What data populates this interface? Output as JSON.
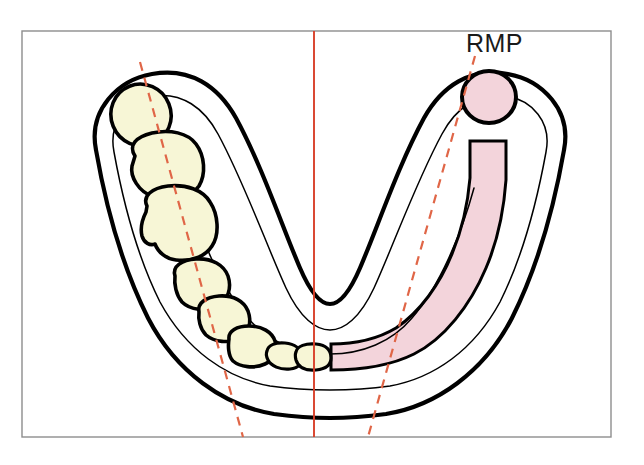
{
  "figure": {
    "background": "#ffffff",
    "frame": {
      "x": 22,
      "y": 31,
      "width": 589,
      "height": 406,
      "stroke": "#8d8d8d",
      "fill": "#ffffff"
    },
    "labels": [
      {
        "id": "rmp",
        "text": "RMP",
        "x": 466,
        "y": 52
      }
    ],
    "header_artifact": " ",
    "colors": {
      "tooth_fill": "#f7f6d6",
      "ridge_pink": "#f3d4db",
      "outline_black": "#000000",
      "midline_red": "#d9402a",
      "dashed_red": "#e06647",
      "frame_gray": "#8d8d8d",
      "page_white": "#ffffff"
    },
    "arch": {
      "description": "U-shaped mandibular (lower) dental arch, buccal and lingual outlines",
      "outer_outline": "M 96 150 C 88 110 118 80 152 74 C 190 67 218 86 236 118 C 262 166 282 226 300 268 C 312 296 322 304 330 304 C 338 304 348 296 360 268 C 378 226 398 166 424 118 C 442 86 470 67 508 74 C 542 80 572 110 564 150 C 556 196 540 262 512 318 C 484 372 436 406 386 414 C 356 418 338 418 330 418 C 322 418 304 418 274 414 C 224 406 176 372 148 318 C 120 262 104 196 96 150 Z",
      "inner_outline": "M 114 152 C 108 122 128 100 154 96 C 182 92 204 108 218 134 C 244 182 266 244 286 288 C 300 318 316 330 330 330 C 344 330 360 318 374 288 C 394 244 416 182 442 134 C 456 108 478 92 506 96 C 532 100 552 122 546 152 C 538 196 524 254 500 302 C 474 350 434 378 390 386 C 362 390 344 390 330 390 C 316 390 298 390 270 386 C 226 378 186 350 160 302 C 136 254 122 196 114 152 Z",
      "lingual_outline": "M 186 188 C 198 232 220 286 248 318 C 268 342 298 354 330 354 C 362 354 392 342 412 318 C 440 286 462 232 474 188"
    },
    "teeth_left": [
      {
        "id": "tooth-38-third-molar",
        "name": "left third molar",
        "type": "ellipse",
        "cx": 141,
        "cy": 115,
        "rx": 30,
        "ry": 31,
        "rot": -22
      },
      {
        "id": "tooth-37-second-molar",
        "name": "left second molar",
        "type": "path",
        "d": "M 135 156 C 128 145 136 137 152 133 C 170 129 188 133 196 144 C 205 156 206 174 199 186 C 191 198 170 202 154 197 C 138 192 130 176 132 166 Z"
      },
      {
        "id": "tooth-36-first-molar",
        "name": "left first molar",
        "type": "path",
        "d": "M 147 206 C 142 196 152 188 168 186 C 186 184 203 190 210 202 C 218 214 220 234 212 246 C 206 256 192 262 176 260 C 166 259 158 252 155 244 C 150 246 144 243 142 236 C 140 228 143 218 146 212 Z"
      },
      {
        "id": "tooth-35-second-premolar",
        "name": "left second premolar",
        "type": "path",
        "d": "M 175 276 C 172 266 182 260 196 259 C 212 258 224 265 228 276 C 232 288 228 300 218 306 C 206 312 190 310 182 302 C 176 295 174 284 175 276 Z"
      },
      {
        "id": "tooth-34-first-premolar",
        "name": "left first premolar",
        "type": "path",
        "d": "M 199 312 C 197 303 206 297 219 296 C 233 295 244 301 248 311 C 252 322 249 333 240 338 C 229 344 214 342 206 335 C 200 329 198 319 199 312 Z"
      },
      {
        "id": "tooth-33-canine",
        "name": "left canine",
        "type": "path",
        "d": "M 229 339 C 228 331 237 326 249 326 C 262 326 272 332 275 341 C 278 351 274 360 265 364 C 254 369 240 367 233 361 C 228 356 228 345 229 339 Z"
      },
      {
        "id": "tooth-32-lateral-incisor",
        "name": "left lateral incisor",
        "type": "path",
        "d": "M 267 351 C 268 345 276 342 285 343 C 295 344 301 349 302 356 C 303 363 299 368 290 369 C 280 370 271 366 268 360 C 266 356 266 353 267 351 Z"
      },
      {
        "id": "tooth-31-central-incisor",
        "name": "left central incisor",
        "type": "path",
        "d": "M 296 352 C 297 346 306 343 316 344 C 327 345 331 350 331 358 C 331 365 326 369 316 370 C 305 371 298 367 296 360 C 295 356 295 354 296 352 Z"
      }
    ],
    "right_side": {
      "description": "Edentulous right side with pink residual ridge band and isolated retromolar pad molar",
      "ridge_band": {
        "id": "residual-ridge-band",
        "name": "residual ridge (pink band)",
        "d": "M 331 344 L 331 370 C 360 370 390 366 414 354 C 444 339 470 306 486 268 C 498 240 504 208 506 180 L 506 141 L 470 141 L 470 178 C 468 202 462 230 452 254 C 440 284 420 312 396 328 C 376 340 352 344 331 344 Z"
      },
      "molar": {
        "id": "molar-rmp",
        "name": "isolated molar at retromolar pad",
        "cx": 489,
        "cy": 97,
        "rx": 27,
        "ry": 26
      }
    },
    "reference_lines": [
      {
        "id": "midline",
        "name": "midsagittal midline",
        "style": "solid",
        "color": "#d9402a",
        "x1": 314,
        "y1": 31,
        "x2": 314,
        "y2": 437
      },
      {
        "id": "left-ridge-crest-line",
        "name": "left ridge crest guideline",
        "style": "dashed",
        "color": "#e06647",
        "x1": 140,
        "y1": 62,
        "x2": 243,
        "y2": 437
      },
      {
        "id": "right-ridge-crest-line",
        "name": "right ridge crest guideline",
        "style": "dashed",
        "color": "#e06647",
        "x1": 475,
        "y1": 56,
        "x2": 368,
        "y2": 437
      }
    ]
  }
}
